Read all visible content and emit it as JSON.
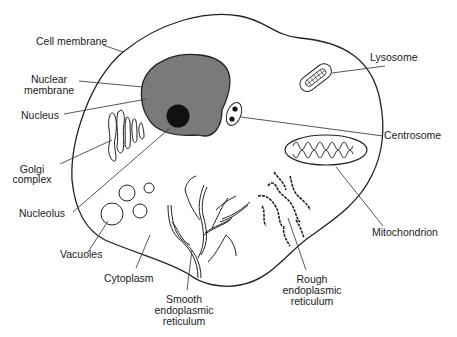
{
  "diagram": {
    "type": "labeled-illustration",
    "colors": {
      "background": "#ffffff",
      "outline": "#222222",
      "nucleus_fill": "#7a7a7a",
      "nucleolus_fill": "#111111",
      "leader_line": "#444444"
    },
    "labels": {
      "cell_membrane": "Cell membrane",
      "nuclear_membrane_1": "Nuclear",
      "nuclear_membrane_2": "membrane",
      "nucleus": "Nucleus",
      "golgi_1": "Golgi",
      "golgi_2": "complex",
      "nucleolus": "Nucleolus",
      "vacuoles": "Vacuoles",
      "cytoplasm": "Cytoplasm",
      "smooth_er_1": "Smooth",
      "smooth_er_2": "endoplasmic",
      "smooth_er_3": "reticulum",
      "rough_er_1": "Rough",
      "rough_er_2": "endoplasmic",
      "rough_er_3": "reticulum",
      "lysosome": "Lysosome",
      "centrosome": "Centrosome",
      "mitochondrion": "Mitochondrion"
    }
  }
}
